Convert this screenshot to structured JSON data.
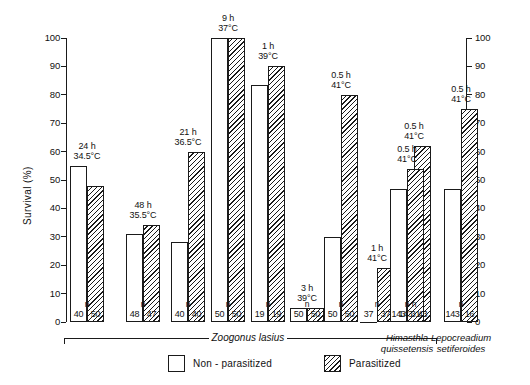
{
  "chart_data": {
    "type": "bar",
    "title": "",
    "xlabel": "",
    "ylabel": "Survival (%)",
    "ylim": [
      0,
      100
    ],
    "ytick_labels": [
      "0",
      "10",
      "20",
      "30",
      "40",
      "50",
      "60",
      "70",
      "80",
      "90",
      "100"
    ],
    "ytick_values": [
      0,
      10,
      20,
      30,
      40,
      50,
      60,
      70,
      80,
      90,
      100
    ],
    "right_axis": true,
    "right_ytick_labels": [
      "0",
      "10",
      "20",
      "30",
      "40",
      "50",
      "60",
      "70",
      "80",
      "90",
      "100"
    ],
    "grid": false,
    "legend_position": "bottom-center",
    "series": [
      {
        "name": "Non - parasitized",
        "style": "open",
        "values": [
          55,
          31,
          28,
          100,
          83.5,
          5,
          30,
          0,
          47,
          47,
          47
        ]
      },
      {
        "name": "Parasitized",
        "style": "hatched",
        "values": [
          48,
          34,
          60,
          100,
          90,
          5,
          80,
          19,
          62,
          54,
          75
        ]
      }
    ],
    "groups": [
      {
        "duration": "24 h",
        "temperature": "34.5°C",
        "n_open": "40",
        "n_hatch": "50",
        "species": "Zoogonus lasius"
      },
      {
        "duration": "48 h",
        "temperature": "35.5°C",
        "n_open": "48",
        "n_hatch": "47",
        "species": "Zoogonus lasius"
      },
      {
        "duration": "21 h",
        "temperature": "36.5°C",
        "n_open": "40",
        "n_hatch": "40",
        "species": "Zoogonus lasius"
      },
      {
        "duration": "9 h",
        "temperature": "37°C",
        "n_open": "50",
        "n_hatch": "50",
        "species": "Zoogonus lasius"
      },
      {
        "duration": "1 h",
        "temperature": "39°C",
        "n_open": "19",
        "n_hatch": "19",
        "species": "Zoogonus lasius"
      },
      {
        "duration": "3 h",
        "temperature": "39°C",
        "n_open": "50",
        "n_hatch": "50",
        "species": "Zoogonus lasius"
      },
      {
        "duration": "0.5 h",
        "temperature": "41°C",
        "n_open": "50",
        "n_hatch": "50",
        "species": "Zoogonus lasius"
      },
      {
        "duration": "1 h",
        "temperature": "41°C",
        "n_open": "37",
        "n_hatch": "37",
        "species": "Zoogonus lasius"
      },
      {
        "duration": "0.5 h",
        "temperature": "41°C",
        "n_open": "143",
        "n_hatch": "43",
        "species": "Zoogonus lasius"
      },
      {
        "duration": "0.5 h",
        "temperature": "41°C",
        "n_open": "143",
        "n_hatch": "31",
        "species": "Himasthla quissetensis"
      },
      {
        "duration": "0.5 h",
        "temperature": "41°C",
        "n_open": "143",
        "n_hatch": "16",
        "species": "Lepocreadium setiferoides"
      }
    ],
    "n_marker_label": "n",
    "species_brackets": [
      {
        "label": "Zoogonus lasius",
        "group_start": 0,
        "group_end": 8
      },
      {
        "label": "Himasthla\nquissetensis",
        "group_start": 9,
        "group_end": 9
      },
      {
        "label": "Lepocreadium\nsetiferoides",
        "group_start": 10,
        "group_end": 10
      }
    ],
    "annotations": [
      "24 h 34.5°C",
      "48 h 35.5°C",
      "21 h 36.5°C",
      "9 h 37°C",
      "1 h 39°C",
      "3 h 39°C",
      "0.5 h 41°C",
      "1 h 41°C",
      "0.5 h 41°C",
      "0.5 h 41°C",
      "0.5 h 41°C"
    ],
    "colors": {
      "ink": "#1a1a1a",
      "background": "#ffffff",
      "bar_fill": "#ffffff"
    }
  },
  "legend": {
    "items": [
      {
        "label": "Non - parasitized",
        "style": "open"
      },
      {
        "label": "Parasitized",
        "style": "hatched"
      }
    ]
  },
  "species_labels": {
    "zoogonus": "Zoogonus lasius",
    "himasthla_line1": "Himasthla",
    "himasthla_line2": "quissetensis",
    "lepocreadium_line1": "Lepocreadium",
    "lepocreadium_line2": "setiferoides"
  },
  "axis": {
    "y_title": "Survival (%)"
  }
}
